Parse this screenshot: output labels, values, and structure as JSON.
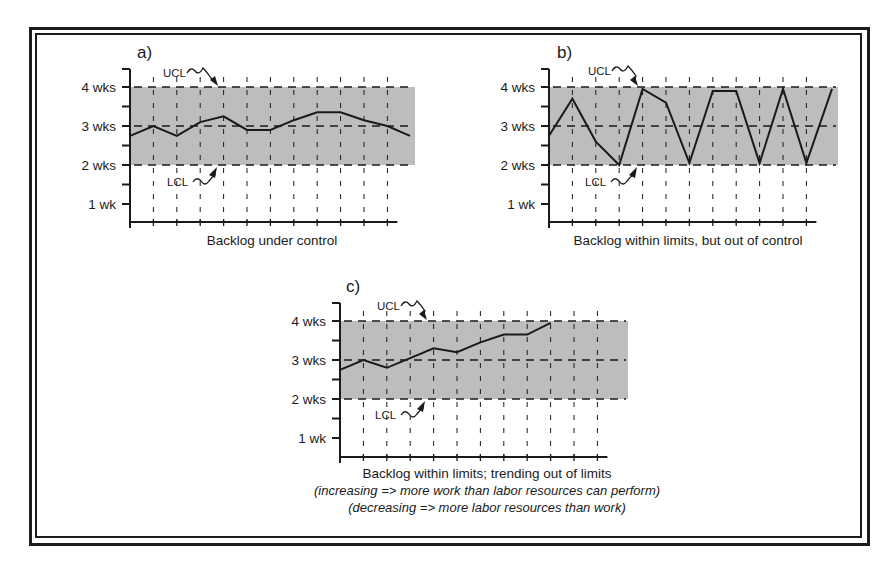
{
  "figure": {
    "frame": {
      "border_color": "#1c1c1c"
    },
    "shade_color": "#bdbdbd",
    "line_color": "#1a1a1a"
  },
  "chart_data": [
    {
      "id": "a",
      "type": "line",
      "panel_label": "a)",
      "title": "Backlog under control",
      "xlabel": "Backlog under control",
      "ylabel": "",
      "y_tick_labels": [
        "4 wks",
        "3 wks",
        "2 wks",
        "1 wk"
      ],
      "y_tick_values": [
        4,
        3,
        2,
        1
      ],
      "ylim": [
        0.55,
        4.5
      ],
      "ucl": 4,
      "lcl": 2,
      "center": 3,
      "ucl_label": "UCL",
      "lcl_label": "LCL",
      "grid": "vertical dashed at each period",
      "x": [
        0,
        1,
        2,
        3,
        4,
        5,
        6,
        7,
        8,
        9,
        10,
        11,
        12
      ],
      "values": [
        2.75,
        3.0,
        2.75,
        3.1,
        3.25,
        2.9,
        2.9,
        3.15,
        3.35,
        3.35,
        3.15,
        3.0,
        2.75
      ],
      "layout": {
        "x0": 130,
        "dx": 23.4,
        "n_grid": 11,
        "y4": 87,
        "y_per_wk": 39,
        "axis_bottom": 222,
        "axis_top": 69,
        "x_end": 410,
        "shade_end": 415,
        "label_x": 137,
        "label_y": 58,
        "ucl_label_x": 163,
        "ucl_label_y": 77,
        "ucl_arrow_tip_x": 218,
        "lcl_label_x": 167,
        "lcl_label_y": 186,
        "lcl_arrow_tip_x": 217,
        "caption_x": 272,
        "caption_y": 245
      }
    },
    {
      "id": "b",
      "type": "line",
      "panel_label": "b)",
      "title": "Backlog within limits, but out of control",
      "xlabel": "Backlog within limits, but out of control",
      "ylabel": "",
      "y_tick_labels": [
        "4 wks",
        "3 wks",
        "2 wks",
        "1 wk"
      ],
      "y_tick_values": [
        4,
        3,
        2,
        1
      ],
      "ylim": [
        0.55,
        4.5
      ],
      "ucl": 4,
      "lcl": 2,
      "center": 3,
      "ucl_label": "UCL",
      "lcl_label": "LCL",
      "grid": "vertical dashed at each period",
      "x": [
        0,
        1,
        2,
        3,
        4,
        5,
        6,
        7,
        8,
        9,
        10,
        11,
        12
      ],
      "values": [
        2.75,
        3.7,
        2.6,
        2.0,
        3.95,
        3.6,
        2.05,
        3.9,
        3.9,
        2.05,
        3.95,
        2.05,
        3.95
      ],
      "layout": {
        "x0": 549,
        "dx": 23.4,
        "n_grid": 11,
        "y4": 87,
        "y_per_wk": 39,
        "axis_bottom": 222,
        "axis_top": 69,
        "x_end": 832,
        "shade_end": 838,
        "label_x": 557,
        "label_y": 58,
        "ucl_label_x": 588,
        "ucl_label_y": 75,
        "ucl_arrow_tip_x": 638,
        "lcl_label_x": 585,
        "lcl_label_y": 186,
        "lcl_arrow_tip_x": 637,
        "caption_x": 688,
        "caption_y": 245
      }
    },
    {
      "id": "c",
      "type": "line",
      "panel_label": "c)",
      "title": "Backlog within limits; trending out of limits",
      "xlabel": "Backlog within limits; trending out of limits",
      "ylabel": "",
      "y_tick_labels": [
        "4 wks",
        "3 wks",
        "2 wks",
        "1 wk"
      ],
      "y_tick_values": [
        4,
        3,
        2,
        1
      ],
      "ylim": [
        0.55,
        4.5
      ],
      "ucl": 4,
      "lcl": 2,
      "center": 3,
      "ucl_label": "UCL",
      "lcl_label": "LCL",
      "grid": "vertical dashed at each period",
      "x": [
        0,
        1,
        2,
        3,
        4,
        5,
        6,
        7,
        8,
        9
      ],
      "values": [
        2.75,
        3.0,
        2.8,
        3.05,
        3.3,
        3.2,
        3.45,
        3.65,
        3.65,
        3.95
      ],
      "annotations": [
        "(increasing => more work than labor resources can perform)",
        "(decreasing => more labor resources than work)"
      ],
      "layout": {
        "x0": 340,
        "dx": 23.4,
        "n_grid": 11,
        "y4": 321,
        "y_per_wk": 39,
        "axis_bottom": 457,
        "axis_top": 303,
        "x_end": 620,
        "shade_end": 628,
        "label_x": 346,
        "label_y": 292,
        "ucl_label_x": 377,
        "ucl_label_y": 310,
        "ucl_arrow_tip_x": 427,
        "lcl_label_x": 375,
        "lcl_label_y": 419,
        "lcl_arrow_tip_x": 425,
        "caption_x": 487,
        "caption_y": 478
      }
    }
  ]
}
